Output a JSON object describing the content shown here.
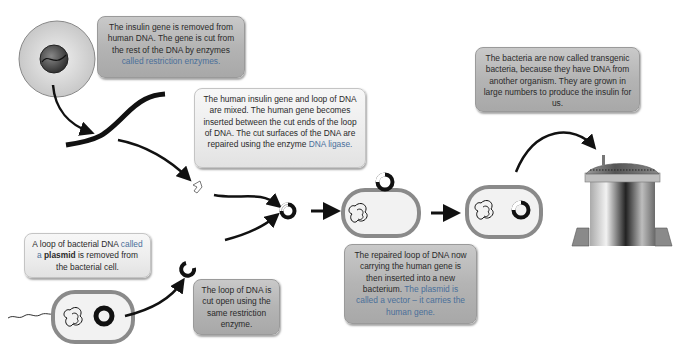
{
  "diagram": {
    "steps": [
      {
        "id": "gene-removal",
        "parts": [
          {
            "text": "The insulin gene is removed from human DNA. The gene is cut from the rest of the DNA by enzymes ",
            "style": "normal"
          },
          {
            "text": "called restriction enzymes.",
            "style": "blue"
          }
        ]
      },
      {
        "id": "mixing",
        "parts": [
          {
            "text": "The human insulin gene and loop of DNA are mixed. The human gene becomes inserted between the cut ends of the loop of DNA. The cut surfaces of the DNA are repaired using the enzyme ",
            "style": "normal"
          },
          {
            "text": "DNA ligase.",
            "style": "blue"
          }
        ]
      },
      {
        "id": "transgenic",
        "parts": [
          {
            "text": "The bacteria are now called transgenic bacteria, because they have DNA from another organism. They are grown in large numbers to produce the insulin for us.",
            "style": "normal"
          }
        ]
      },
      {
        "id": "plasmid-removal",
        "parts": [
          {
            "text": "A loop of bacterial DNA ",
            "style": "normal"
          },
          {
            "text": "called a ",
            "style": "blue"
          },
          {
            "text": "plasmid",
            "style": "bold"
          },
          {
            "text": " is removed from the bacterial cell.",
            "style": "normal"
          }
        ]
      },
      {
        "id": "cut-open",
        "parts": [
          {
            "text": "The loop of DNA is cut open using the same restriction enzyme.",
            "style": "normal"
          }
        ]
      },
      {
        "id": "insertion",
        "parts": [
          {
            "text": "The repaired loop of DNA now carrying the human gene is then inserted into a new bacterium. ",
            "style": "normal"
          },
          {
            "text": "The plasmid is called a vector – it carries the human gene.",
            "style": "blue"
          }
        ]
      }
    ],
    "icons": [
      "human-cell-icon",
      "dna-strand-icon",
      "insulin-gene-fragment-icon",
      "bacterium-icon",
      "plasmid-icon",
      "cut-plasmid-icon",
      "recombinant-plasmid-icon",
      "transgenic-bacterium-icon",
      "fermenter-tank-icon",
      "arrow-icon"
    ]
  }
}
